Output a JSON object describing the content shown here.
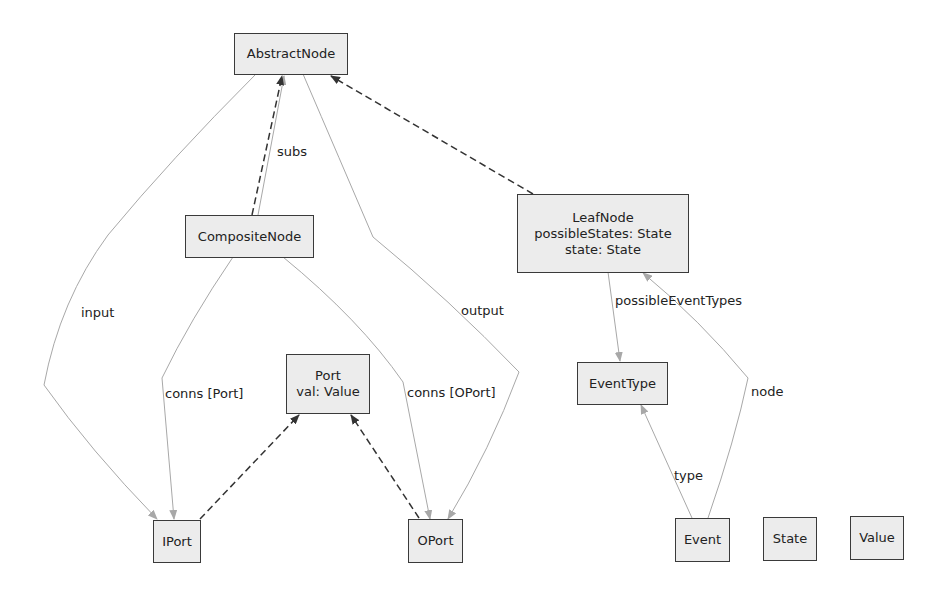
{
  "diagram": {
    "type": "class-diagram",
    "colors": {
      "node_fill": "#ececec",
      "node_border": "#3a3a3a",
      "association_edge": "#a8a8a8",
      "inheritance_edge": "#333333"
    },
    "nodes": {
      "abstract_node": {
        "lines": [
          "AbstractNode"
        ]
      },
      "composite_node": {
        "lines": [
          "CompositeNode"
        ]
      },
      "leaf_node": {
        "lines": [
          "LeafNode",
          "possibleStates: State",
          "state: State"
        ]
      },
      "port": {
        "lines": [
          "Port",
          "val: Value"
        ]
      },
      "event_type": {
        "lines": [
          "EventType"
        ]
      },
      "iport": {
        "lines": [
          "IPort"
        ]
      },
      "oport": {
        "lines": [
          "OPort"
        ]
      },
      "event": {
        "lines": [
          "Event"
        ]
      },
      "state": {
        "lines": [
          "State"
        ]
      },
      "value": {
        "lines": [
          "Value"
        ]
      }
    },
    "edge_labels": {
      "subs": "subs",
      "input": "input",
      "output": "output",
      "conns_port": "conns [Port]",
      "conns_oport": "conns [OPort]",
      "possible_event_types": "possibleEventTypes",
      "type": "type",
      "node": "node"
    },
    "edges": [
      {
        "from": "CompositeNode",
        "to": "AbstractNode",
        "kind": "inheritance"
      },
      {
        "from": "LeafNode",
        "to": "AbstractNode",
        "kind": "inheritance"
      },
      {
        "from": "IPort",
        "to": "Port",
        "kind": "inheritance"
      },
      {
        "from": "OPort",
        "to": "Port",
        "kind": "inheritance"
      },
      {
        "from": "CompositeNode",
        "to": "AbstractNode",
        "kind": "association",
        "label": "subs"
      },
      {
        "from": "AbstractNode",
        "to": "IPort",
        "kind": "association",
        "label": "input"
      },
      {
        "from": "AbstractNode",
        "to": "OPort",
        "kind": "association",
        "label": "output"
      },
      {
        "from": "CompositeNode",
        "to": "IPort",
        "kind": "association",
        "label": "conns [Port]"
      },
      {
        "from": "CompositeNode",
        "to": "OPort",
        "kind": "association",
        "label": "conns [OPort]"
      },
      {
        "from": "LeafNode",
        "to": "EventType",
        "kind": "association",
        "label": "possibleEventTypes"
      },
      {
        "from": "Event",
        "to": "EventType",
        "kind": "association",
        "label": "type"
      },
      {
        "from": "Event",
        "to": "LeafNode",
        "kind": "association",
        "label": "node"
      }
    ]
  }
}
